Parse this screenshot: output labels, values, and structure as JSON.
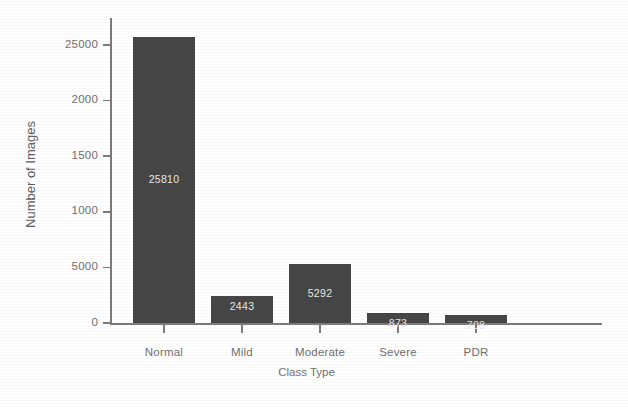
{
  "chart_data": {
    "type": "bar",
    "title": "",
    "xlabel": "Class Type",
    "ylabel": "Number of Images",
    "categories": [
      "Normal",
      "Mild",
      "Moderate",
      "Severe",
      "PDR"
    ],
    "values": [
      25810,
      2443,
      5292,
      873,
      708
    ],
    "value_labels": [
      "25810",
      "2443",
      "5292",
      "873",
      "708"
    ],
    "ytick_labels": [
      "25000",
      "2000",
      "1500",
      "1000",
      "5000",
      "0"
    ],
    "ytick_values": [
      25000,
      20000,
      15000,
      10000,
      5000,
      0
    ],
    "ylim": [
      0,
      27500
    ],
    "grid": false,
    "legend": null,
    "bar_color": "#464646",
    "value_label_color": "#e8e8e8",
    "axis_color": "#7b7b7b",
    "tick_label_color": "#6f6f6f",
    "background": "#ffffff"
  }
}
